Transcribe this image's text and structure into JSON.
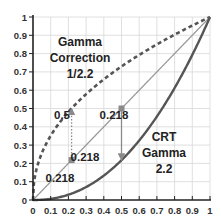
{
  "chart_data": {
    "type": "line",
    "title": "",
    "xlabel": "",
    "ylabel": "",
    "xlim": [
      0,
      1
    ],
    "ylim": [
      0,
      1
    ],
    "grid": true,
    "x_ticks": [
      "0",
      "0.1",
      "0.2",
      "0.3",
      "0.4",
      "0.5",
      "0.6",
      "0.7",
      "0.8",
      "0.9",
      "1"
    ],
    "y_ticks": [
      "0",
      "0.1",
      "0.2",
      "0.3",
      "0.4",
      "0.5",
      "0.6",
      "0.7",
      "0.8",
      "0.9",
      "1"
    ],
    "series": [
      {
        "name": "Gamma Correction 1/2.2",
        "function": "x^(1/2.2)",
        "exponent": 0.4545,
        "style": "dashed",
        "color": "#555555"
      },
      {
        "name": "Linear",
        "function": "x",
        "exponent": 1,
        "style": "solid",
        "color": "#9a9a9a"
      },
      {
        "name": "CRT Gamma 2.2",
        "function": "x^2.2",
        "exponent": 2.2,
        "style": "solid",
        "color": "#555555"
      }
    ],
    "markers": [
      {
        "x": 0.218,
        "y": 0.218,
        "label": "0.218"
      },
      {
        "x": 0.5,
        "y": 0.5,
        "label": "0.5"
      }
    ],
    "arrows": [
      {
        "x": 0.218,
        "from": 0.218,
        "to": 0.5,
        "style": "dotted",
        "label": "0.5"
      },
      {
        "x": 0.5,
        "from": 0.5,
        "to": 0.218,
        "style": "solid",
        "label": "0.218"
      }
    ],
    "annotations": [
      {
        "lines": [
          "Gamma",
          "Correction",
          "1/2.2"
        ],
        "position": "upper-left"
      },
      {
        "lines": [
          "CRT",
          "Gamma",
          "2.2"
        ],
        "position": "lower-right"
      }
    ]
  }
}
